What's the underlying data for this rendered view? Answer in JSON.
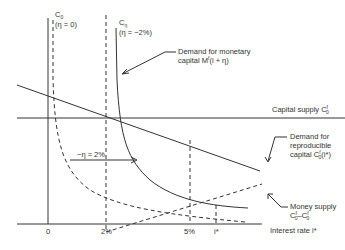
{
  "diagram": {
    "type": "economics-interest-rate-diagram",
    "curves": {
      "c0": {
        "name": "C",
        "sub": "0",
        "param": "(η = 0)"
      },
      "ceta": {
        "name": "C",
        "sub": "η",
        "param": "(η = −2%)"
      }
    },
    "labels": {
      "demand_monetary_line1": "Demand for monetary",
      "demand_monetary_line2": "capital M",
      "demand_monetary_sup": "f",
      "demand_monetary_tail": "(i + η)",
      "capital_supply": "Capital supply C",
      "capital_supply_sub": "0",
      "capital_supply_sup": "f",
      "demand_repro_line1": "Demand for",
      "demand_repro_line2": "reproducible",
      "demand_repro_line3": "capital C",
      "demand_repro_sub": "0",
      "demand_repro_sup": "f",
      "demand_repro_tail": "(i*)",
      "shift": "−η = 2%",
      "money_supply_line1": "Money supply",
      "money_supply_line2_a": "C",
      "money_supply_line2_b": "–C",
      "x_axis_label": "Interest rate i*"
    },
    "x_ticks": [
      "0",
      "2%",
      "5%",
      "i*"
    ],
    "colors": {
      "line": "#333333",
      "background": "#ffffff"
    }
  }
}
